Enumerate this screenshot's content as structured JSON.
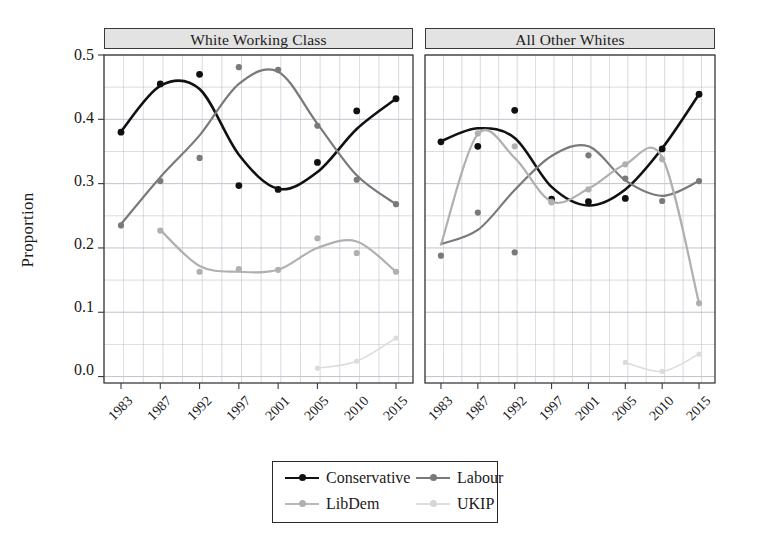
{
  "chart_data": {
    "type": "line",
    "title": "",
    "xlabel": "",
    "ylabel": "Proportion",
    "ylim": [
      0.0,
      0.5
    ],
    "yticks": [
      "0.0",
      "0.1",
      "0.2",
      "0.3",
      "0.4",
      "0.5"
    ],
    "ytick_values": [
      0.0,
      0.1,
      0.2,
      0.3,
      0.4,
      0.5
    ],
    "categories": [
      "1983",
      "1987",
      "1992",
      "1997",
      "2001",
      "2005",
      "2010",
      "2015"
    ],
    "x": [
      1983,
      1987,
      1992,
      1997,
      2001,
      2005,
      2010,
      2015
    ],
    "grid": true,
    "legend_position": "bottom-center",
    "legend_entries": [
      "Conservative",
      "Labour",
      "LibDem",
      "UKIP"
    ],
    "colors": {
      "Conservative": "#111111",
      "Labour": "#7a7a7a",
      "LibDem": "#b0b0b0",
      "UKIP": "#dcdcdc",
      "grid": "#b9b9c6",
      "axis": "#3a3a3a",
      "panel_strip": "#e3e3e3"
    },
    "panels": [
      {
        "name": "White Working Class",
        "series": [
          {
            "name": "Conservative",
            "color": "#111111",
            "points": [
              0.38,
              0.455,
              0.47,
              0.297,
              0.291,
              0.333,
              0.413,
              0.432
            ],
            "smooth": [
              0.381,
              0.452,
              0.447,
              0.345,
              0.292,
              0.318,
              0.385,
              0.432
            ]
          },
          {
            "name": "Labour",
            "color": "#7a7a7a",
            "points": [
              0.235,
              0.304,
              0.34,
              0.481,
              0.477,
              0.39,
              0.306,
              0.268
            ],
            "smooth": [
              0.237,
              0.31,
              0.375,
              0.455,
              0.474,
              0.393,
              0.313,
              0.268
            ]
          },
          {
            "name": "LibDem",
            "color": "#b0b0b0",
            "points": [
              null,
              0.227,
              0.163,
              0.167,
              0.166,
              0.215,
              0.192,
              0.163
            ],
            "smooth": [
              null,
              0.228,
              0.172,
              0.163,
              0.166,
              0.2,
              0.21,
              0.163
            ]
          },
          {
            "name": "UKIP",
            "color": "#dcdcdc",
            "points": [
              null,
              null,
              null,
              null,
              null,
              0.013,
              0.024,
              0.06
            ],
            "smooth": [
              null,
              null,
              null,
              null,
              null,
              0.013,
              0.024,
              0.06
            ]
          }
        ]
      },
      {
        "name": "All Other Whites",
        "series": [
          {
            "name": "Conservative",
            "color": "#111111",
            "points": [
              0.365,
              0.358,
              0.414,
              0.276,
              0.272,
              0.277,
              0.354,
              0.439
            ],
            "smooth": [
              0.366,
              0.386,
              0.371,
              0.295,
              0.266,
              0.291,
              0.355,
              0.439
            ]
          },
          {
            "name": "Labour",
            "color": "#7a7a7a",
            "points": [
              0.188,
              0.255,
              0.193,
              0.272,
              0.344,
              0.308,
              0.273,
              0.304
            ],
            "smooth": [
              0.206,
              0.228,
              0.29,
              0.343,
              0.358,
              0.305,
              0.281,
              0.304
            ]
          },
          {
            "name": "LibDem",
            "color": "#b0b0b0",
            "points": [
              null,
              0.378,
              0.358,
              0.271,
              0.291,
              0.33,
              0.338,
              0.114
            ],
            "smooth": [
              0.205,
              0.377,
              0.34,
              0.272,
              0.292,
              0.33,
              0.341,
              0.114
            ]
          },
          {
            "name": "UKIP",
            "color": "#dcdcdc",
            "points": [
              null,
              null,
              null,
              null,
              null,
              0.022,
              0.008,
              0.035
            ],
            "smooth": [
              null,
              null,
              null,
              null,
              null,
              0.022,
              0.008,
              0.035
            ]
          }
        ]
      }
    ]
  },
  "axis": {
    "ylabel": "Proportion",
    "yticks": [
      "0.5",
      "0.4",
      "0.3",
      "0.2",
      "0.1",
      "0.0"
    ],
    "xticks": [
      "1983",
      "1987",
      "1992",
      "1997",
      "2001",
      "2005",
      "2010",
      "2015"
    ]
  },
  "panels": {
    "left_title": "White Working Class",
    "right_title": "All Other Whites"
  },
  "legend": {
    "items": [
      {
        "label": "Conservative",
        "color": "#111111"
      },
      {
        "label": "Labour",
        "color": "#7a7a7a"
      },
      {
        "label": "LibDem",
        "color": "#b0b0b0"
      },
      {
        "label": "UKIP",
        "color": "#dcdcdc"
      }
    ]
  }
}
